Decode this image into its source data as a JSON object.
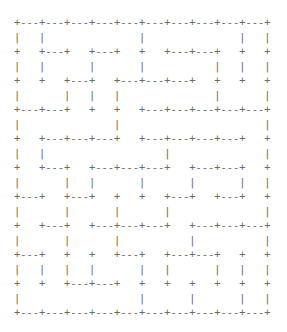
{
  "maze": {
    "rows": 10,
    "cols": 10,
    "lines": [
      "+---+---+---+---+---+---+---+---+---+---+",
      "|   |               |               |   |",
      "+   +---+   +---+   +   +---+---+   +   +",
      "|   |       |       |           |   |   |",
      "+   +   +---+   +---+---+---+   +   +   +",
      "|       |   |   |               |       |",
      "+---+---+   +   +   +---+---+---+---+---+",
      "|               |                       |",
      "+   +---+---+---+   +---+---+---+---+   +",
      "|   |                   |               |",
      "+   +---+   +---+---+---+   +---+---+   +",
      "|       |   |       |       |       |   |",
      "+---+   +---+   +   +   +---+   +---+   +",
      "|       |       |       |               |",
      "+   +---+   +---+---+---+   +---+---+---+",
      "|       |       |           |           |",
      "+---+   +   +   +---+   +---+---+   +   +",
      "|   |   |   |       |   |       |   |   |",
      "+   +   +---+---+   +   +   +   +   +   +",
      "|                   |       |       |   |",
      "+---+---+---+---+---+---+---+---+---+---+"
    ]
  }
}
